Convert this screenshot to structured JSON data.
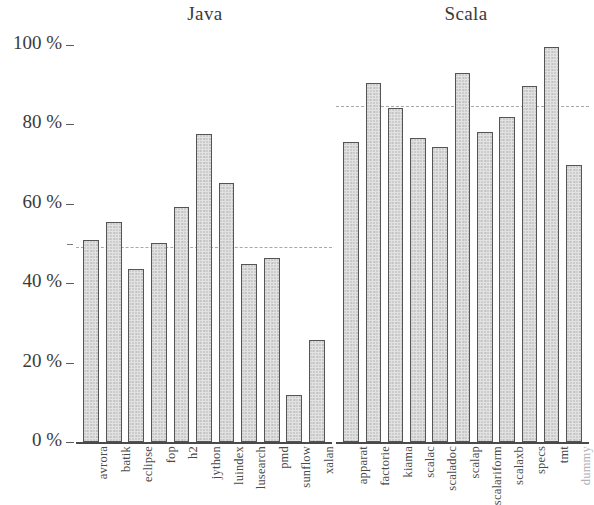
{
  "chart_data": {
    "type": "bar",
    "title": "",
    "xlabel": "",
    "ylabel": "",
    "ylim": [
      0,
      100
    ],
    "y_unit": "%",
    "grid": false,
    "legend": null,
    "y_ticks": [
      0,
      20,
      40,
      60,
      80,
      100
    ],
    "y_tick_labels": [
      "0 %",
      "20 %",
      "40 %",
      "60 %",
      "80 %",
      "100 %"
    ],
    "y_minor_ticks": [
      50
    ],
    "groups": [
      {
        "name": "Java",
        "mean_line": 49,
        "categories": [
          "avrora",
          "batik",
          "eclipse",
          "fop",
          "h2",
          "jython",
          "luindex",
          "lusearch",
          "pmd",
          "sunflow",
          "xalan"
        ],
        "values": [
          51,
          55.4,
          43.6,
          50.1,
          59.2,
          77.6,
          65.3,
          44.8,
          46.3,
          11.8,
          25.7
        ],
        "faint_labels": []
      },
      {
        "name": "Scala",
        "mean_line": 84.6,
        "categories": [
          "apparat",
          "factorie",
          "kiama",
          "scalac",
          "scaladoc",
          "scalap",
          "scalariform",
          "scalaxb",
          "specs",
          "tmt",
          "dummy"
        ],
        "values": [
          75.6,
          90.4,
          84.1,
          76.6,
          74.3,
          93.0,
          78.1,
          81.9,
          89.7,
          99.4,
          69.8
        ],
        "faint_labels": [
          "dummy"
        ]
      }
    ],
    "colors": {
      "bar_fill": "#e2e2e2",
      "bar_stroke": "#555555",
      "axis": "#4a4a4a",
      "mean_line": "#a8a8a8",
      "text": "#3a3a3a",
      "faint_text": "#b3b3b3",
      "background": "#ffffff"
    }
  },
  "titles": {
    "java": "Java",
    "scala": "Scala"
  }
}
